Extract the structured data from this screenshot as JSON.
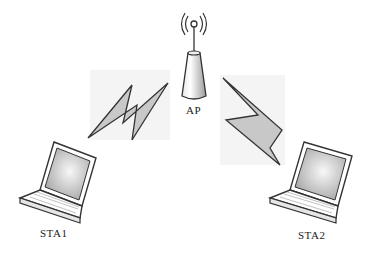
{
  "diagram": {
    "type": "wireless-network-topology",
    "nodes": [
      {
        "id": "ap",
        "label": "AP",
        "kind": "access-point"
      },
      {
        "id": "sta1",
        "label": "STA1",
        "kind": "laptop"
      },
      {
        "id": "sta2",
        "label": "STA2",
        "kind": "laptop"
      }
    ],
    "links": [
      {
        "from": "ap",
        "to": "sta1",
        "style": "wireless-bolt"
      },
      {
        "from": "ap",
        "to": "sta2",
        "style": "wireless-bolt"
      }
    ],
    "colors": {
      "stroke": "#333333",
      "bolt_fill": "#c8c8c8",
      "screen_fill": "#d0d0d0",
      "background": "#ffffff"
    }
  }
}
